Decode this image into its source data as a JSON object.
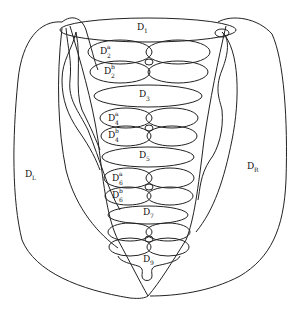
{
  "diagram": {
    "regions": [
      {
        "id": "D1",
        "base": "D",
        "sub": "1",
        "sup": ""
      },
      {
        "id": "D2a",
        "base": "D",
        "sub": "2",
        "sup": "a"
      },
      {
        "id": "D2b",
        "base": "D",
        "sub": "2",
        "sup": "b"
      },
      {
        "id": "D3",
        "base": "D",
        "sub": "3",
        "sup": ""
      },
      {
        "id": "D4a",
        "base": "D",
        "sub": "4",
        "sup": "a"
      },
      {
        "id": "D4b",
        "base": "D",
        "sub": "4",
        "sup": "b"
      },
      {
        "id": "D5",
        "base": "D",
        "sub": "5",
        "sup": ""
      },
      {
        "id": "D6a",
        "base": "D",
        "sub": "6",
        "sup": "a"
      },
      {
        "id": "D6b",
        "base": "D",
        "sub": "6",
        "sup": "b"
      },
      {
        "id": "D7",
        "base": "D",
        "sub": "7",
        "sup": ""
      },
      {
        "id": "D9",
        "base": "D",
        "sub": "9",
        "sup": ""
      },
      {
        "id": "DL",
        "base": "D",
        "sub": "L",
        "sup": ""
      },
      {
        "id": "DR",
        "base": "D",
        "sub": "R",
        "sup": ""
      }
    ],
    "stroke_color": "#222222",
    "background": "#ffffff"
  }
}
